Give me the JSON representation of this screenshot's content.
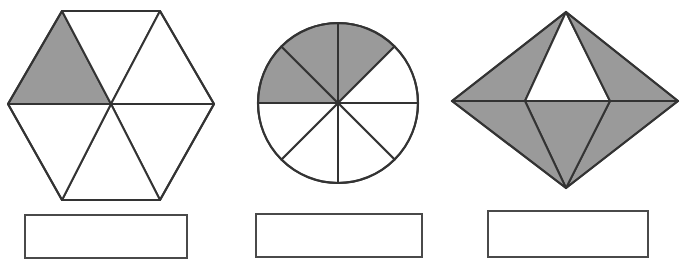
{
  "page": {
    "background_color": "#ffffff",
    "width": 683,
    "height": 270
  },
  "style": {
    "shaded_fill": "#9a9a9a",
    "unshaded_fill": "#ffffff",
    "stroke_color": "#333333",
    "box_border_color": "#4a4a4a"
  },
  "figures": [
    {
      "id": "hexagon",
      "name": "regular-hexagon-six-triangles",
      "shape": "hexagon",
      "total_parts": 6,
      "shaded_parts": 1,
      "fraction_shaded": "1/6",
      "center": {
        "x": 111,
        "y": 104
      },
      "vertices": [
        {
          "x": 62,
          "y": 11
        },
        {
          "x": 160,
          "y": 11
        },
        {
          "x": 214,
          "y": 104
        },
        {
          "x": 160,
          "y": 200
        },
        {
          "x": 62,
          "y": 200
        },
        {
          "x": 8,
          "y": 104
        }
      ],
      "shaded_indices": [
        0
      ]
    },
    {
      "id": "circle",
      "name": "circle-eight-sectors",
      "shape": "circle",
      "total_parts": 8,
      "shaded_parts": 3,
      "fraction_shaded": "3/8",
      "center": {
        "x": 338,
        "y": 103
      },
      "radius": 80,
      "sector_start_angle_deg": 180,
      "shaded_indices": [
        0,
        1,
        2
      ]
    },
    {
      "id": "rhombus",
      "name": "rhombus-six-triangles",
      "shape": "rhombus",
      "total_parts": 6,
      "shaded_parts": 5,
      "fraction_shaded": "5/6",
      "vertices": {
        "top": {
          "x": 566,
          "y": 12
        },
        "right": {
          "x": 678,
          "y": 101
        },
        "bottom": {
          "x": 566,
          "y": 188
        },
        "left": {
          "x": 452,
          "y": 101
        },
        "inner_left": {
          "x": 525,
          "y": 101
        },
        "inner_right": {
          "x": 610,
          "y": 101
        }
      },
      "shaded_indices": [
        0,
        2,
        3,
        4,
        5
      ],
      "unshaded_indices": [
        1
      ]
    }
  ],
  "answer_boxes": [
    {
      "name": "answer-box-hexagon",
      "value": "",
      "placeholder": ""
    },
    {
      "name": "answer-box-circle",
      "value": "",
      "placeholder": ""
    },
    {
      "name": "answer-box-rhombus",
      "value": "",
      "placeholder": ""
    }
  ]
}
